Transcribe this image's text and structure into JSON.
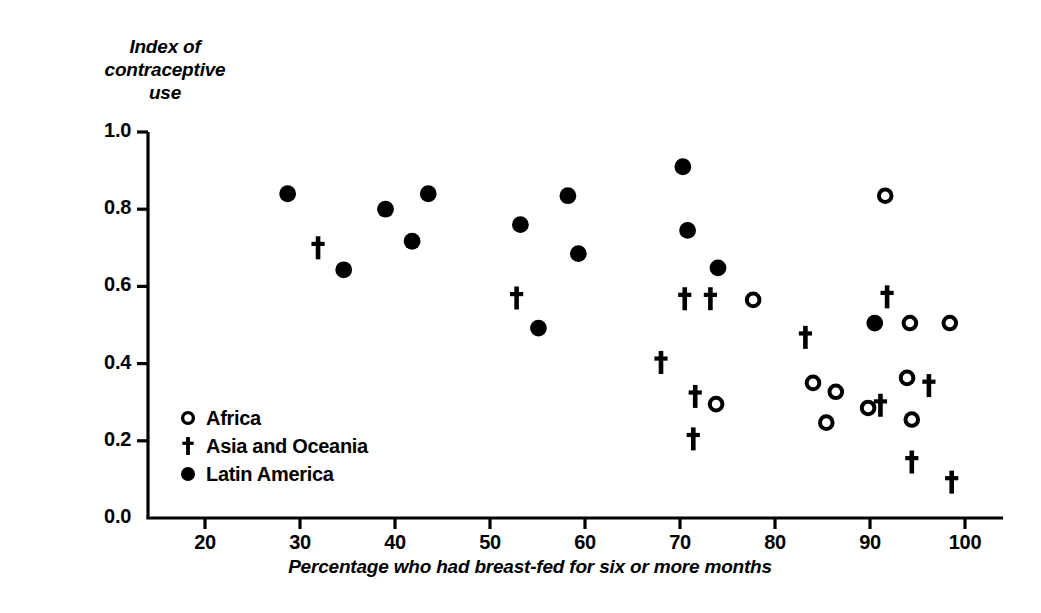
{
  "chart_data": {
    "type": "scatter",
    "title": "",
    "ylabel": "Index of\ncontraceptive\nuse",
    "xlabel": "Percentage who had breast-fed for six or more months",
    "xlim": [
      14,
      104
    ],
    "ylim": [
      0.0,
      1.0
    ],
    "xticks": [
      20,
      30,
      40,
      50,
      60,
      70,
      80,
      90,
      100
    ],
    "xtick_labels": [
      "20",
      "30",
      "40",
      "50",
      "60",
      "70",
      "80",
      "90",
      "100"
    ],
    "yticks": [
      0.0,
      0.2,
      0.4,
      0.6,
      0.8,
      1.0
    ],
    "ytick_labels": [
      "0.0",
      "0.2",
      "0.4",
      "0.6",
      "0.8",
      "1.0"
    ],
    "grid": false,
    "legend_position": "lower-left-inside",
    "marker_color": "#000000",
    "series": [
      {
        "name": "Africa",
        "marker": "open-circle",
        "points": [
          {
            "x": 77.7,
            "y": 0.565
          },
          {
            "x": 73.8,
            "y": 0.295
          },
          {
            "x": 91.6,
            "y": 0.835
          },
          {
            "x": 94.2,
            "y": 0.505
          },
          {
            "x": 98.4,
            "y": 0.505
          },
          {
            "x": 84.0,
            "y": 0.35
          },
          {
            "x": 86.4,
            "y": 0.327
          },
          {
            "x": 85.4,
            "y": 0.247
          },
          {
            "x": 89.8,
            "y": 0.285
          },
          {
            "x": 93.9,
            "y": 0.363
          },
          {
            "x": 94.4,
            "y": 0.255
          }
        ]
      },
      {
        "name": "Asia and Oceania",
        "marker": "dagger",
        "points": [
          {
            "x": 31.9,
            "y": 0.7
          },
          {
            "x": 52.8,
            "y": 0.57
          },
          {
            "x": 68.0,
            "y": 0.403
          },
          {
            "x": 70.5,
            "y": 0.568
          },
          {
            "x": 73.2,
            "y": 0.568
          },
          {
            "x": 71.6,
            "y": 0.315
          },
          {
            "x": 71.4,
            "y": 0.205
          },
          {
            "x": 83.2,
            "y": 0.468
          },
          {
            "x": 91.8,
            "y": 0.573
          },
          {
            "x": 91.1,
            "y": 0.292
          },
          {
            "x": 96.2,
            "y": 0.343
          },
          {
            "x": 94.4,
            "y": 0.145
          },
          {
            "x": 98.6,
            "y": 0.093
          }
        ]
      },
      {
        "name": "Latin America",
        "marker": "filled-circle",
        "points": [
          {
            "x": 28.7,
            "y": 0.84
          },
          {
            "x": 34.6,
            "y": 0.643
          },
          {
            "x": 39.0,
            "y": 0.8
          },
          {
            "x": 41.8,
            "y": 0.717
          },
          {
            "x": 43.5,
            "y": 0.84
          },
          {
            "x": 53.2,
            "y": 0.76
          },
          {
            "x": 55.1,
            "y": 0.492
          },
          {
            "x": 58.2,
            "y": 0.835
          },
          {
            "x": 59.3,
            "y": 0.685
          },
          {
            "x": 70.3,
            "y": 0.91
          },
          {
            "x": 70.8,
            "y": 0.745
          },
          {
            "x": 74.0,
            "y": 0.648
          },
          {
            "x": 90.5,
            "y": 0.505
          }
        ]
      }
    ]
  },
  "legend": {
    "items": [
      {
        "label": "Africa",
        "marker": "open-circle"
      },
      {
        "label": "Asia and Oceania",
        "marker": "dagger"
      },
      {
        "label": "Latin America",
        "marker": "filled-circle"
      }
    ]
  },
  "axis": {
    "y_title_line1": "Index of",
    "y_title_line2": "contraceptive",
    "y_title_line3": "use",
    "x_title": "Percentage who had breast-fed for six or more months"
  }
}
